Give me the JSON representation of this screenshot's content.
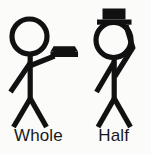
{
  "image": {
    "title": "Whole and Half note stick figure mnemonic",
    "background_color": "#fbfbfa",
    "ink_color": "#111111"
  },
  "figures": [
    {
      "id": "whole-figure",
      "label": "Whole",
      "description": "Stick figure holding a hat out in an extended arm",
      "hat_position": "held-in-hand",
      "head_style": "open-circle"
    },
    {
      "id": "half-figure",
      "label": "Half",
      "description": "Stick figure wearing a hat on the head with arm bent up toward it",
      "hat_position": "on-head",
      "head_style": "open-circle"
    }
  ],
  "labels": {
    "left": "Whole",
    "right": "Half"
  }
}
